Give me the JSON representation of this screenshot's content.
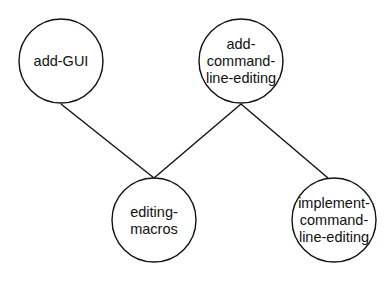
{
  "diagram": {
    "type": "dependency-tree",
    "colors": {
      "background": "#ffffff",
      "stroke": "#111111",
      "text": "#111111"
    },
    "nodes": [
      {
        "id": "add-GUI",
        "lines": [
          "add-GUI"
        ],
        "cx": 61,
        "cy": 61,
        "r": 42
      },
      {
        "id": "add-command-line-editing",
        "lines": [
          "add-",
          "command-",
          "line-editing"
        ],
        "cx": 241,
        "cy": 61,
        "r": 42
      },
      {
        "id": "editing-macros",
        "lines": [
          "editing-",
          "macros"
        ],
        "cx": 154,
        "cy": 220,
        "r": 42
      },
      {
        "id": "implement-command-line-editing",
        "lines": [
          "implement-",
          "command-",
          "line-editing"
        ],
        "cx": 334,
        "cy": 220,
        "r": 42
      }
    ],
    "edges": [
      {
        "from": "add-GUI",
        "to": "editing-macros",
        "x1": 61,
        "y1": 104,
        "x2": 154,
        "y2": 178
      },
      {
        "from": "add-command-line-editing",
        "to": "editing-macros",
        "x1": 241,
        "y1": 104,
        "x2": 154,
        "y2": 178
      },
      {
        "from": "add-command-line-editing",
        "to": "implement-command-line-editing",
        "x1": 241,
        "y1": 104,
        "x2": 328,
        "y2": 178
      }
    ]
  }
}
